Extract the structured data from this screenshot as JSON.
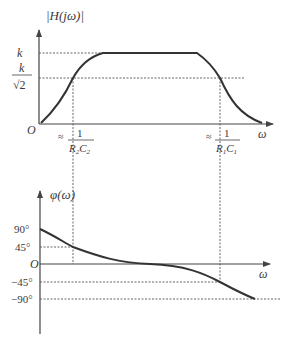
{
  "magnitude_plot": {
    "y_label": "|H(jω)|",
    "level_k": "k",
    "level_k_sqrt2_num": "k",
    "level_k_sqrt2_den": "√2",
    "origin": "O",
    "x_label": "ω",
    "cutoff_low": {
      "prefix": "≈",
      "num": "1",
      "den_a": "R",
      "den_a_sub": "2",
      "den_b": "C",
      "den_b_sub": "2"
    },
    "cutoff_high": {
      "prefix": "≈",
      "num": "1",
      "den_a": "R",
      "den_a_sub": "1",
      "den_b": "C",
      "den_b_sub": "1"
    }
  },
  "phase_plot": {
    "y_label": "φ(ω)",
    "ticks": [
      "90°",
      "45°",
      "O",
      "−45°",
      "−90°"
    ],
    "x_label": "ω"
  },
  "colors": {
    "curve": "#333333",
    "axis": "#444444",
    "guide": "#555555"
  }
}
